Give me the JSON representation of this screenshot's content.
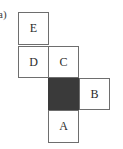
{
  "figure": {
    "part_label": "a)",
    "cell_size_px": 31,
    "colors": {
      "shaded_fill": "#3a3a3a",
      "cell_stroke": "#6e6e6e",
      "cell_fill": "#ffffff",
      "text": "#2b2b2b"
    },
    "cells": [
      {
        "id": "cell-E",
        "label": "E",
        "column": 0,
        "row": 0,
        "shaded": false
      },
      {
        "id": "cell-D",
        "label": "D",
        "column": 0,
        "row": 1,
        "shaded": false
      },
      {
        "id": "cell-C",
        "label": "C",
        "column": 1,
        "row": 1,
        "shaded": false
      },
      {
        "id": "cell-shaded",
        "label": "",
        "column": 1,
        "row": 2,
        "shaded": true
      },
      {
        "id": "cell-B",
        "label": "B",
        "column": 2,
        "row": 2,
        "shaded": false
      },
      {
        "id": "cell-A",
        "label": "A",
        "column": 1,
        "row": 3,
        "shaded": false
      }
    ]
  }
}
